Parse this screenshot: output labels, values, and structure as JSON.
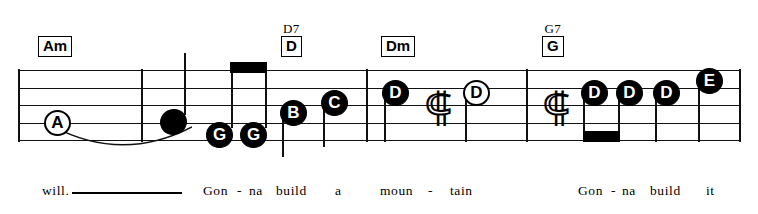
{
  "sheet": {
    "title": "Gonna Build A Mountain - excerpt",
    "staff": {
      "line_count": 5,
      "left": 18,
      "right": 740,
      "top_y": 70,
      "line_spacing": 17.5
    },
    "chords": [
      {
        "id": "chord-am",
        "label": "Am",
        "alt": "",
        "x": 38,
        "y": 36
      },
      {
        "id": "chord-d",
        "label": "D",
        "alt": "D7",
        "x": 281,
        "y": 22
      },
      {
        "id": "chord-dm",
        "label": "Dm",
        "alt": "",
        "x": 381,
        "y": 36
      },
      {
        "id": "chord-g",
        "label": "G",
        "alt": "G7",
        "x": 542,
        "y": 22
      }
    ],
    "barlines": [
      {
        "id": "barline-start",
        "x": 18,
        "top": 69,
        "height": 73
      },
      {
        "id": "barline-1",
        "x": 141,
        "top": 69,
        "height": 73
      },
      {
        "id": "barline-2",
        "x": 366,
        "top": 69,
        "height": 73
      },
      {
        "id": "barline-3",
        "x": 526,
        "top": 69,
        "height": 73
      },
      {
        "id": "barline-end",
        "x": 739,
        "top": 69,
        "height": 73
      }
    ],
    "notes": [
      {
        "id": "note-a",
        "label": "A",
        "style": "hollow",
        "x": 44,
        "y": 110,
        "stem": null
      },
      {
        "id": "note-tie-head",
        "label": "",
        "style": "plain",
        "x": 160,
        "y": 109,
        "stem": {
          "x": 184,
          "top": 53,
          "height": 62
        }
      },
      {
        "id": "note-g1",
        "label": "G",
        "style": "filled",
        "x": 206,
        "y": 122,
        "stem": {
          "x": 231,
          "top": 66,
          "height": 62
        }
      },
      {
        "id": "note-g2",
        "label": "G",
        "style": "filled",
        "x": 240,
        "y": 122,
        "stem": {
          "x": 265,
          "top": 66,
          "height": 62
        }
      },
      {
        "id": "note-b",
        "label": "B",
        "style": "filled",
        "x": 280,
        "y": 100,
        "stem": {
          "x": 282,
          "top": 110,
          "height": 47
        }
      },
      {
        "id": "note-c",
        "label": "C",
        "style": "filled",
        "x": 321,
        "y": 90,
        "stem": {
          "x": 323,
          "top": 100,
          "height": 47
        }
      },
      {
        "id": "note-d1",
        "label": "D",
        "style": "filled",
        "x": 382,
        "y": 80,
        "stem": {
          "x": 384,
          "top": 90,
          "height": 52
        }
      },
      {
        "id": "note-d2",
        "label": "D",
        "style": "hollow",
        "x": 463,
        "y": 80,
        "stem": {
          "x": 465,
          "top": 90,
          "height": 52
        }
      },
      {
        "id": "note-d3",
        "label": "D",
        "style": "filled",
        "x": 581,
        "y": 80,
        "stem": {
          "x": 583,
          "top": 90,
          "height": 48
        }
      },
      {
        "id": "note-d4",
        "label": "D",
        "style": "filled",
        "x": 616,
        "y": 80,
        "stem": {
          "x": 618,
          "top": 90,
          "height": 48
        }
      },
      {
        "id": "note-d5",
        "label": "D",
        "style": "filled",
        "x": 653,
        "y": 80,
        "stem": {
          "x": 655,
          "top": 90,
          "height": 52
        }
      },
      {
        "id": "note-e",
        "label": "E",
        "style": "filled",
        "x": 696,
        "y": 68,
        "stem": {
          "x": 698,
          "top": 78,
          "height": 64
        }
      }
    ],
    "beams": [
      {
        "id": "beam-upper-gg",
        "x": 230,
        "y": 62,
        "width": 37,
        "height": 11
      },
      {
        "id": "beam-lower-dd",
        "x": 583,
        "y": 131,
        "width": 37,
        "height": 11
      }
    ],
    "rests": [
      {
        "id": "rest-1",
        "glyph": "⸿",
        "x": 424,
        "y": 87
      },
      {
        "id": "rest-2",
        "glyph": "⸿",
        "x": 542,
        "y": 87
      }
    ],
    "slur": {
      "id": "slur-a-to-tie",
      "x": 52,
      "y": 126,
      "width": 140,
      "height": 24
    },
    "lyrics": [
      {
        "id": "lyric-will",
        "text": "will.",
        "x": 42,
        "y": 183
      },
      {
        "id": "lyric-gon1",
        "text": "Gon",
        "x": 203,
        "y": 183
      },
      {
        "id": "lyric-dash1",
        "text": "-",
        "x": 237,
        "y": 183
      },
      {
        "id": "lyric-na1",
        "text": "na",
        "x": 249,
        "y": 183
      },
      {
        "id": "lyric-build1",
        "text": "build",
        "x": 276,
        "y": 183
      },
      {
        "id": "lyric-a",
        "text": "a",
        "x": 335,
        "y": 183
      },
      {
        "id": "lyric-moun",
        "text": "moun",
        "x": 380,
        "y": 183
      },
      {
        "id": "lyric-dash2",
        "text": "-",
        "x": 428,
        "y": 183
      },
      {
        "id": "lyric-tain",
        "text": "tain",
        "x": 450,
        "y": 183
      },
      {
        "id": "lyric-gon2",
        "text": "Gon",
        "x": 578,
        "y": 183
      },
      {
        "id": "lyric-dash3",
        "text": "-",
        "x": 611,
        "y": 183
      },
      {
        "id": "lyric-na2",
        "text": "na",
        "x": 622,
        "y": 183
      },
      {
        "id": "lyric-build2",
        "text": "build",
        "x": 650,
        "y": 183
      },
      {
        "id": "lyric-it",
        "text": "it",
        "x": 706,
        "y": 183
      }
    ],
    "lyric_extender": {
      "id": "lyric-extender-will",
      "x": 72,
      "y": 192,
      "width": 110
    }
  },
  "colors": {
    "ink": "#111111",
    "paper": "#ffffff"
  }
}
